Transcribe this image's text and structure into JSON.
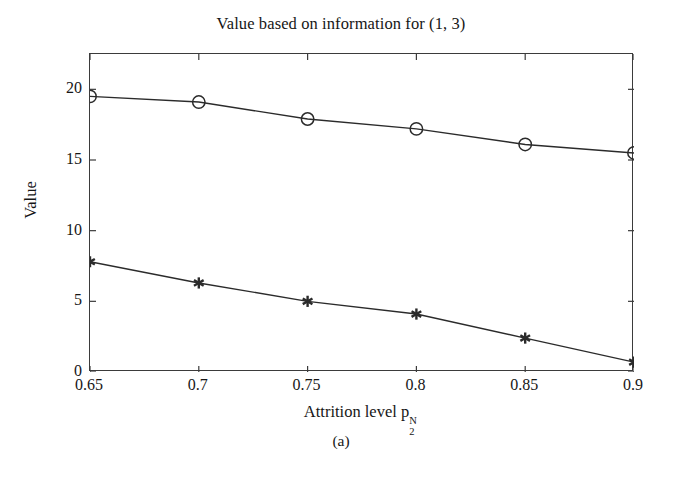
{
  "figure": {
    "title": "Value based on information for (1, 3)",
    "caption": "(a)",
    "background_color": "#ffffff",
    "axis_color": "#3b3b3b",
    "line_color": "#2b2b2b"
  },
  "axes": {
    "xlabel_text": "Attrition level p",
    "xlabel_sub": "2",
    "xlabel_sup": "N",
    "ylabel": "Value",
    "xticks": [
      "0.65",
      "0.7",
      "0.75",
      "0.8",
      "0.85",
      "0.9"
    ],
    "yticks": [
      "0",
      "5",
      "10",
      "15",
      "20"
    ]
  },
  "chart_data": {
    "type": "line",
    "title": "Value based on information for (1, 3)",
    "xlabel": "Attrition level p_2^N",
    "ylabel": "Value",
    "x": [
      0.65,
      0.7,
      0.75,
      0.8,
      0.85,
      0.9
    ],
    "xlim": [
      0.65,
      0.9
    ],
    "ylim": [
      0,
      22.5
    ],
    "xticks": [
      0.65,
      0.7,
      0.75,
      0.8,
      0.85,
      0.9
    ],
    "yticks": [
      0,
      5,
      10,
      15,
      20
    ],
    "grid": false,
    "legend": null,
    "series": [
      {
        "name": "upper-curve",
        "marker": "circle",
        "values": [
          19.5,
          19.1,
          17.9,
          17.2,
          16.1,
          15.5
        ]
      },
      {
        "name": "lower-curve",
        "marker": "asterisk",
        "values": [
          7.8,
          6.3,
          5.0,
          4.1,
          2.4,
          0.7
        ]
      }
    ]
  }
}
